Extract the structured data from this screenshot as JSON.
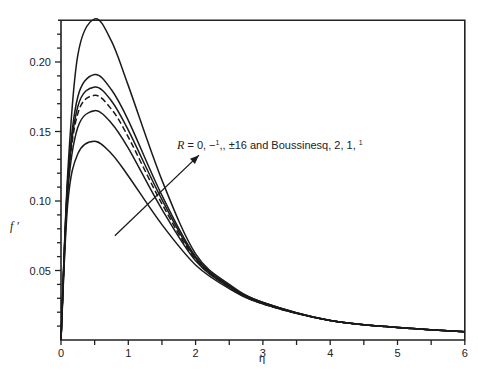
{
  "chart_data": {
    "type": "line",
    "title": "",
    "xlabel": "η",
    "ylabel": "f ′",
    "xlim": [
      0,
      6
    ],
    "ylim": [
      0,
      0.23
    ],
    "grid": false,
    "legend": "none",
    "x_ticks": [
      "0",
      "1",
      "2",
      "3",
      "4",
      "5",
      "6"
    ],
    "y_ticks": [
      "0.05",
      "0.10",
      "0.15",
      "0.20"
    ],
    "annotation": {
      "text": "R = 0, −½, ±16 and Boussinesq, 2, 1, ½",
      "arrow_from": [
        0.8,
        0.075
      ],
      "arrow_to": [
        2.05,
        0.133
      ],
      "meaning": "direction of increasing curve ordering"
    },
    "x": [
      0,
      0.1,
      0.25,
      0.5,
      0.75,
      1.0,
      1.5,
      2.0,
      2.5,
      3.0,
      4.0,
      5.0,
      6.0
    ],
    "series": [
      {
        "name": "curve 1 (highest)",
        "style": "solid",
        "values": [
          0,
          0.12,
          0.205,
          0.231,
          0.215,
          0.183,
          0.115,
          0.062,
          0.04,
          0.027,
          0.014,
          0.009,
          0.006
        ]
      },
      {
        "name": "curve 2",
        "style": "solid",
        "values": [
          0,
          0.115,
          0.175,
          0.191,
          0.18,
          0.158,
          0.104,
          0.06,
          0.039,
          0.027,
          0.014,
          0.009,
          0.006
        ]
      },
      {
        "name": "curve 3",
        "style": "solid",
        "values": [
          0,
          0.112,
          0.168,
          0.182,
          0.172,
          0.151,
          0.101,
          0.059,
          0.039,
          0.027,
          0.014,
          0.009,
          0.006
        ]
      },
      {
        "name": "curve 4 (Boussinesq)",
        "style": "dashed",
        "values": [
          0,
          0.11,
          0.163,
          0.176,
          0.166,
          0.146,
          0.098,
          0.058,
          0.038,
          0.026,
          0.014,
          0.009,
          0.006
        ]
      },
      {
        "name": "curve 5",
        "style": "solid",
        "values": [
          0,
          0.106,
          0.153,
          0.165,
          0.156,
          0.138,
          0.094,
          0.057,
          0.038,
          0.026,
          0.014,
          0.009,
          0.006
        ]
      },
      {
        "name": "curve 6 (lowest)",
        "style": "solid",
        "values": [
          0,
          0.098,
          0.134,
          0.143,
          0.134,
          0.118,
          0.083,
          0.054,
          0.037,
          0.026,
          0.014,
          0.009,
          0.006
        ]
      }
    ]
  },
  "labels": {
    "xlabel": "η",
    "ylabel": "f ′",
    "annotation_prefix": "R",
    "annotation_body": " = 0, −",
    "annotation_mid": ", ±16 and Boussinesq, 2, 1, ",
    "half_num": "1",
    "half_den": "2"
  }
}
